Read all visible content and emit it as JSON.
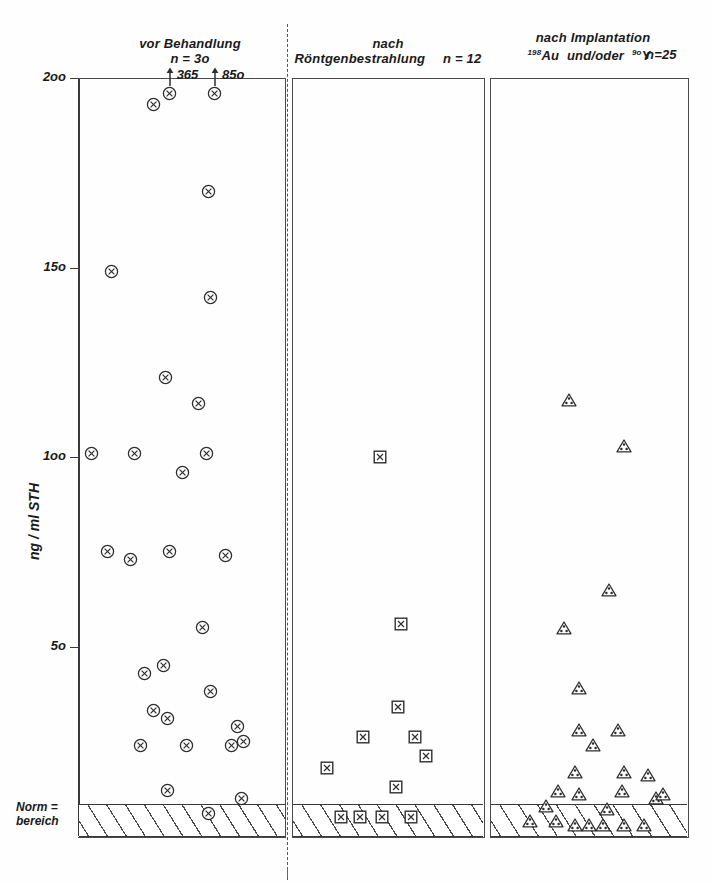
{
  "figure": {
    "y_axis_label": "ng / ml  STH",
    "y_ticks": [
      {
        "value": 200,
        "label": "2oo"
      },
      {
        "value": 150,
        "label": "15o"
      },
      {
        "value": 100,
        "label": "1oo"
      },
      {
        "value": 50,
        "label": "5o"
      }
    ],
    "norm_label_line1": "Norm =",
    "norm_label_line2": "bereich",
    "marker_colors": {
      "stroke": "#333333",
      "fill": "#ffffff"
    }
  },
  "panels": [
    {
      "id": "vor-behandlung",
      "title_lines": [
        "vor Behandlung"
      ],
      "n_label": "n = 3o",
      "marker": "circle-x",
      "annotations": [
        {
          "text": "365",
          "value": 200
        },
        {
          "text": "85o",
          "value": 200
        }
      ]
    },
    {
      "id": "nach-roentgenbestrahlung",
      "title_lines": [
        "nach",
        "Röntgenbestrahlung"
      ],
      "n_label": "n = 12",
      "marker": "square-x",
      "annotations": []
    },
    {
      "id": "nach-implantation",
      "title_lines": [
        "nach Implantation",
        "Au   und/oder    Y"
      ],
      "title_sup_1": "198",
      "title_sup_2": "9o",
      "n_label": "n=25",
      "marker": "triangle-dots",
      "annotations": []
    }
  ],
  "chart_data": {
    "type": "scatter",
    "title": "",
    "xlabel": "",
    "ylabel": "ng / ml STH",
    "ylim": [
      0,
      200
    ],
    "yticks": [
      50,
      100,
      150,
      200
    ],
    "grid": false,
    "legend": "none",
    "normal_range_band": {
      "label": "Norm = bereich",
      "ymin": 0,
      "ymax": 9
    },
    "series": [
      {
        "name": "vor Behandlung",
        "n": 30,
        "marker": "circle-x",
        "offscale_values": [
          365,
          850
        ],
        "points": [
          {
            "x": 0.36,
            "y": 193
          },
          {
            "x": 0.44,
            "y": 196,
            "label": "365"
          },
          {
            "x": 0.66,
            "y": 196,
            "label": "85o"
          },
          {
            "x": 0.63,
            "y": 170
          },
          {
            "x": 0.16,
            "y": 149
          },
          {
            "x": 0.64,
            "y": 142
          },
          {
            "x": 0.42,
            "y": 121
          },
          {
            "x": 0.58,
            "y": 114
          },
          {
            "x": 0.06,
            "y": 101
          },
          {
            "x": 0.27,
            "y": 101
          },
          {
            "x": 0.62,
            "y": 101
          },
          {
            "x": 0.5,
            "y": 96
          },
          {
            "x": 0.14,
            "y": 75
          },
          {
            "x": 0.25,
            "y": 73
          },
          {
            "x": 0.44,
            "y": 75
          },
          {
            "x": 0.71,
            "y": 74
          },
          {
            "x": 0.6,
            "y": 55
          },
          {
            "x": 0.32,
            "y": 43
          },
          {
            "x": 0.41,
            "y": 45
          },
          {
            "x": 0.64,
            "y": 38
          },
          {
            "x": 0.36,
            "y": 33
          },
          {
            "x": 0.43,
            "y": 31
          },
          {
            "x": 0.77,
            "y": 29
          },
          {
            "x": 0.3,
            "y": 24
          },
          {
            "x": 0.52,
            "y": 24
          },
          {
            "x": 0.74,
            "y": 24
          },
          {
            "x": 0.8,
            "y": 25
          },
          {
            "x": 0.43,
            "y": 12
          },
          {
            "x": 0.63,
            "y": 6
          },
          {
            "x": 0.79,
            "y": 10
          }
        ]
      },
      {
        "name": "nach Röntgenbestrahlung",
        "n": 12,
        "marker": "square-x",
        "points": [
          {
            "x": 0.46,
            "y": 100
          },
          {
            "x": 0.57,
            "y": 56
          },
          {
            "x": 0.55,
            "y": 34
          },
          {
            "x": 0.37,
            "y": 26
          },
          {
            "x": 0.64,
            "y": 26
          },
          {
            "x": 0.7,
            "y": 21
          },
          {
            "x": 0.54,
            "y": 13
          },
          {
            "x": 0.25,
            "y": 5
          },
          {
            "x": 0.35,
            "y": 5
          },
          {
            "x": 0.47,
            "y": 5
          },
          {
            "x": 0.62,
            "y": 5
          },
          {
            "x": 0.18,
            "y": 18
          }
        ]
      },
      {
        "name": "nach Implantation 198Au und/oder 90Y",
        "n": 25,
        "marker": "triangle-dots",
        "points": [
          {
            "x": 0.4,
            "y": 115
          },
          {
            "x": 0.68,
            "y": 103
          },
          {
            "x": 0.6,
            "y": 65
          },
          {
            "x": 0.37,
            "y": 55
          },
          {
            "x": 0.45,
            "y": 39
          },
          {
            "x": 0.45,
            "y": 28
          },
          {
            "x": 0.65,
            "y": 28
          },
          {
            "x": 0.52,
            "y": 24
          },
          {
            "x": 0.43,
            "y": 17
          },
          {
            "x": 0.68,
            "y": 17
          },
          {
            "x": 0.8,
            "y": 16
          },
          {
            "x": 0.34,
            "y": 12
          },
          {
            "x": 0.45,
            "y": 11
          },
          {
            "x": 0.67,
            "y": 12
          },
          {
            "x": 0.84,
            "y": 10
          },
          {
            "x": 0.88,
            "y": 11
          },
          {
            "x": 0.28,
            "y": 8
          },
          {
            "x": 0.59,
            "y": 7
          },
          {
            "x": 0.2,
            "y": 4
          },
          {
            "x": 0.33,
            "y": 4
          },
          {
            "x": 0.43,
            "y": 3
          },
          {
            "x": 0.5,
            "y": 3
          },
          {
            "x": 0.57,
            "y": 3
          },
          {
            "x": 0.68,
            "y": 3
          },
          {
            "x": 0.78,
            "y": 3
          }
        ]
      }
    ]
  }
}
